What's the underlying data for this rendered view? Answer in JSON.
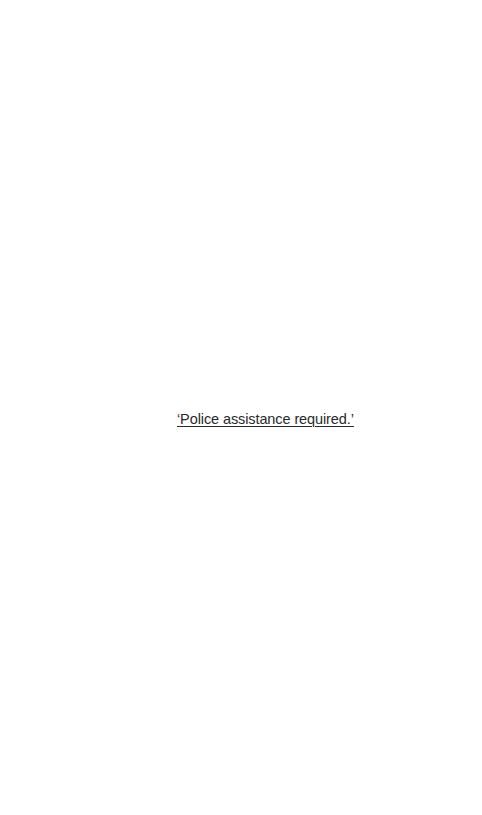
{
  "document": {
    "text": "‘Police assistance required.’"
  }
}
